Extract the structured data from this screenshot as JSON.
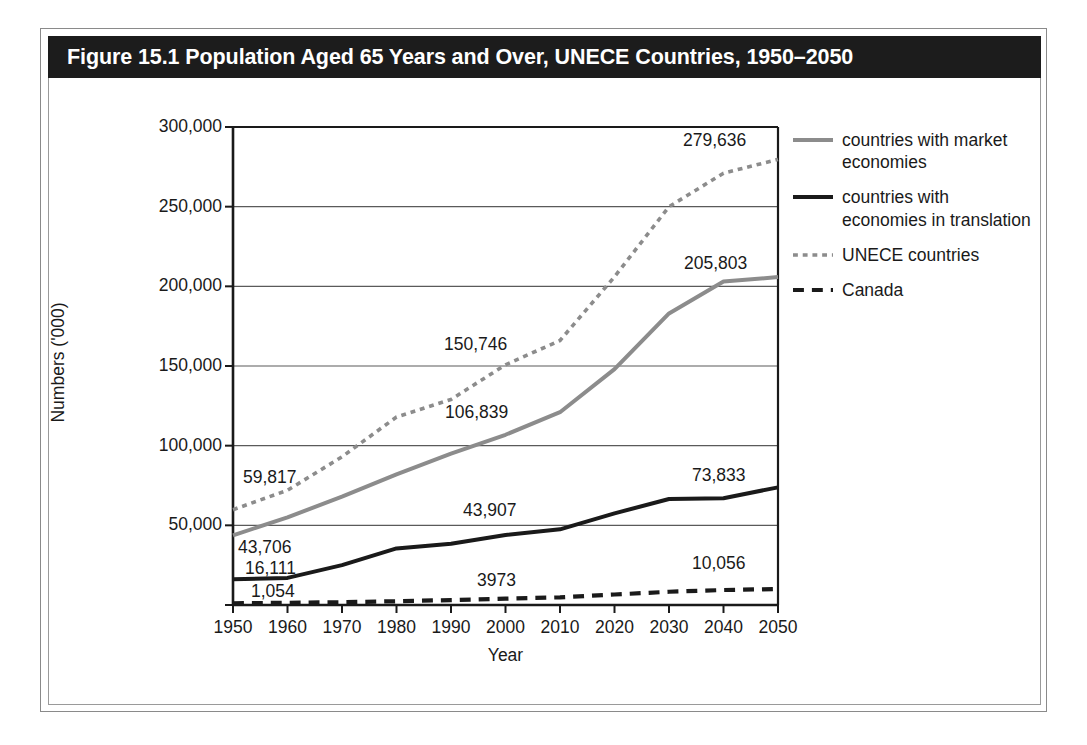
{
  "figure": {
    "title": "Figure 15.1 Population Aged 65 Years and Over, UNECE Countries, 1950–2050"
  },
  "colors": {
    "title_bar_bg": "#1c1c1c",
    "title_text": "#ffffff",
    "gray_series": "#8c8c8c",
    "black_series": "#1a1a1a",
    "gridline": "#5a5a5a",
    "axis": "#1a1a1a",
    "frame": "#8a8a8a"
  },
  "legend": {
    "position": "right",
    "items": [
      {
        "label": "countries with market economies",
        "style": "solid",
        "color": "#8c8c8c",
        "icon": "line-solid-gray-icon"
      },
      {
        "label": "countries with economies in translation",
        "style": "solid",
        "color": "#1a1a1a",
        "icon": "line-solid-black-icon"
      },
      {
        "label": "UNECE countries",
        "style": "dotted",
        "color": "#8c8c8c",
        "icon": "line-dotted-gray-icon"
      },
      {
        "label": "Canada",
        "style": "dashed",
        "color": "#1a1a1a",
        "icon": "line-dashed-black-icon"
      }
    ]
  },
  "axes": {
    "y_title": "Numbers ('000)",
    "x_title": "Year",
    "y_ticks": [
      "0",
      "50,000",
      "100,000",
      "150,000",
      "200,000",
      "250,000",
      "300,000"
    ],
    "x_ticks": [
      "1950",
      "1960",
      "1970",
      "1980",
      "1990",
      "2000",
      "2010",
      "2020",
      "2030",
      "2040",
      "2050"
    ]
  },
  "annotations": [
    {
      "text": "59,817",
      "series": "UNECE countries",
      "year": 1950,
      "x": 243,
      "y": 467
    },
    {
      "text": "43,706",
      "series": "countries with market economies",
      "year": 1950,
      "x": 238,
      "y": 537
    },
    {
      "text": "16,111",
      "series": "countries with economies in translation",
      "year": 1950,
      "x": 245,
      "y": 558
    },
    {
      "text": "1,054",
      "series": "Canada",
      "year": 1950,
      "x": 251,
      "y": 581
    },
    {
      "text": "150,746",
      "series": "UNECE countries",
      "year": 2000,
      "x": 444,
      "y": 334
    },
    {
      "text": "106,839",
      "series": "countries with market economies",
      "year": 2000,
      "x": 445,
      "y": 402
    },
    {
      "text": "43,907",
      "series": "countries with economies in translation",
      "year": 2000,
      "x": 463,
      "y": 500
    },
    {
      "text": "3973",
      "series": "Canada",
      "year": 2000,
      "x": 477,
      "y": 570
    },
    {
      "text": "279,636",
      "series": "UNECE countries",
      "year": 2050,
      "x": 683,
      "y": 130
    },
    {
      "text": "205,803",
      "series": "countries with market economies",
      "year": 2050,
      "x": 684,
      "y": 253
    },
    {
      "text": "73,833",
      "series": "countries with economies in translation",
      "year": 2050,
      "x": 692,
      "y": 465
    },
    {
      "text": "10,056",
      "series": "Canada",
      "year": 2050,
      "x": 692,
      "y": 553
    }
  ],
  "chart_data": {
    "type": "line",
    "title": "Figure 15.1 Population Aged 65 Years and Over, UNECE Countries, 1950–2050",
    "xlabel": "Year",
    "ylabel": "Numbers ('000)",
    "x": [
      1950,
      1960,
      1970,
      1980,
      1990,
      2000,
      2010,
      2020,
      2030,
      2040,
      2050
    ],
    "xlim": [
      1950,
      2050
    ],
    "ylim": [
      0,
      300000
    ],
    "ytick_interval": 50000,
    "grid": "horizontal",
    "legend_position": "right",
    "series": [
      {
        "name": "countries with market economies",
        "style": "solid",
        "color": "#8c8c8c",
        "values": [
          43706,
          55000,
          68000,
          82000,
          95000,
          106839,
          121000,
          148000,
          183000,
          203000,
          205803
        ]
      },
      {
        "name": "countries with economies in translation",
        "style": "solid",
        "color": "#1a1a1a",
        "values": [
          16111,
          17000,
          25000,
          35500,
          38500,
          43907,
          47500,
          57500,
          66500,
          67000,
          73833
        ]
      },
      {
        "name": "UNECE countries",
        "style": "dotted",
        "color": "#8c8c8c",
        "values": [
          59817,
          72000,
          93000,
          118000,
          129000,
          150746,
          166000,
          206000,
          250000,
          271000,
          279636
        ]
      },
      {
        "name": "Canada",
        "style": "dashed",
        "color": "#1a1a1a",
        "values": [
          1054,
          1400,
          1750,
          2350,
          3100,
          3973,
          4800,
          6600,
          8300,
          9400,
          10056
        ]
      }
    ]
  }
}
